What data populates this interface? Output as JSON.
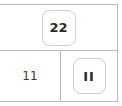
{
  "table": {
    "rows": [
      {
        "name": "merged-header-row",
        "cells": [
          {
            "name": "cell-top",
            "type": "chip",
            "value": "22",
            "colspan": 2
          }
        ]
      },
      {
        "name": "data-row",
        "cells": [
          {
            "name": "cell-bottom-left",
            "type": "text",
            "value": "11"
          },
          {
            "name": "cell-bottom-right",
            "type": "chip",
            "value": "II"
          }
        ]
      }
    ]
  },
  "colors": {
    "grid_line": "#b9b9b9",
    "chip_border": "#cfcfcf",
    "chip_background": "#ffffff",
    "chip_text": "#2b2b2b",
    "plain_text": "#3a3a3a",
    "page_background": "#ffffff"
  }
}
